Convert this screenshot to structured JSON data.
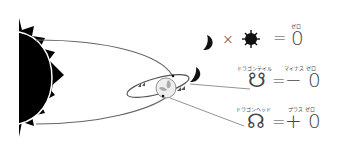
{
  "diagram": {
    "type": "astronomical-diagram",
    "colors": {
      "sun": "#000000",
      "orbit_line": "#666666",
      "text": "#444444",
      "earth": "#bbbbbb"
    },
    "equation_1": {
      "moon_symbol": "moon-icon",
      "times": "×",
      "sun_symbol": "sun-icon",
      "equals": "=",
      "value": "0",
      "value_ruby": "ゼロ"
    },
    "equation_2": {
      "node_symbol": "☋",
      "node_ruby": "ドラゴンテイル",
      "equals": "=",
      "value": "− 0",
      "value_ruby": "マイナス ゼロ"
    },
    "equation_3": {
      "node_symbol": "☊",
      "node_ruby": "ドラゴンヘッド",
      "equals": "=",
      "value": "+ 0",
      "value_ruby": "プラス ゼロ"
    }
  }
}
